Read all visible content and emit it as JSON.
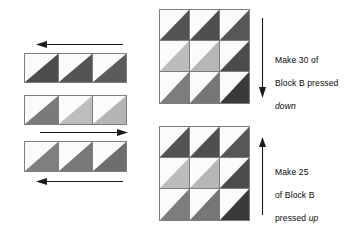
{
  "figure": {
    "type": "quilt-block-assembly-diagram",
    "background_color": "#ffffff"
  },
  "palette": {
    "dark": "#4d4d4d",
    "dark_deep": "#3a3a3a",
    "medium": "#7a7a7a",
    "light": "#b9b9b9",
    "background_light": "#fbfbfb",
    "outline": "#7d7d7d",
    "arrow": "#1a1a1a",
    "text": "#0b0b0b"
  },
  "left_panel": {
    "name": "row-assembly-sequence",
    "rows": [
      {
        "label": "row-1",
        "press_direction": "left",
        "arrow_position": "above",
        "arrow_label": "press-left-arrow",
        "units": [
          {
            "shade": "dark",
            "orientation": "lower-left"
          },
          {
            "shade": "dark",
            "orientation": "lower-left"
          },
          {
            "shade": "dark",
            "orientation": "lower-left"
          }
        ]
      },
      {
        "label": "row-2",
        "press_direction": "right",
        "arrow_position": "below",
        "arrow_label": "press-right-arrow",
        "units": [
          {
            "shade": "medium",
            "orientation": "lower-left"
          },
          {
            "shade": "light",
            "orientation": "lower-left"
          },
          {
            "shade": "light",
            "orientation": "lower-left"
          }
        ]
      },
      {
        "label": "row-3",
        "press_direction": "left",
        "arrow_position": "below",
        "arrow_label": "press-left-arrow",
        "units": [
          {
            "shade": "medium",
            "orientation": "lower-left"
          },
          {
            "shade": "medium",
            "orientation": "lower-left"
          },
          {
            "shade": "medium",
            "orientation": "lower-left"
          }
        ]
      }
    ]
  },
  "right_panel": {
    "name": "finished-blocks",
    "blocks": [
      {
        "id": "block-b-pressed-down",
        "grid": [
          [
            {
              "shade": "dark"
            },
            {
              "shade": "dark"
            },
            {
              "shade": "dark"
            }
          ],
          [
            {
              "shade": "light"
            },
            {
              "shade": "light"
            },
            {
              "shade": "dark"
            }
          ],
          [
            {
              "shade": "medium"
            },
            {
              "shade": "medium"
            },
            {
              "shade": "dark_deep"
            }
          ]
        ],
        "arrow": {
          "direction": "down",
          "name": "pressed-down-arrow"
        },
        "caption_lines": [
          "Make 30 of",
          "Block B pressed",
          "down"
        ],
        "caption_emphasis_line": 2,
        "caption_text": "Make 30 of Block B pressed down",
        "count": 30
      },
      {
        "id": "block-b-pressed-up",
        "grid": [
          [
            {
              "shade": "dark"
            },
            {
              "shade": "dark"
            },
            {
              "shade": "dark"
            }
          ],
          [
            {
              "shade": "light"
            },
            {
              "shade": "light"
            },
            {
              "shade": "dark"
            }
          ],
          [
            {
              "shade": "medium"
            },
            {
              "shade": "medium"
            },
            {
              "shade": "dark_deep"
            }
          ]
        ],
        "arrow": {
          "direction": "up",
          "name": "pressed-up-arrow"
        },
        "caption_lines": [
          "Make 25",
          "of Block B",
          "pressed up"
        ],
        "caption_emphasis_word": "up",
        "caption_text": "Make 25 of Block B pressed up",
        "count": 25
      }
    ]
  },
  "captions": {
    "top": {
      "line1": "Make 30 of",
      "line2": "Block B pressed",
      "line3": "down"
    },
    "bottom": {
      "line1": "Make 25",
      "line2": "of Block B",
      "line3_pre": "pressed ",
      "line3_em": "up"
    }
  }
}
